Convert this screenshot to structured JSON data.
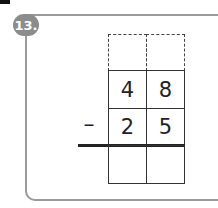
{
  "problem": {
    "number_label": "13.",
    "carry_row": [
      "",
      ""
    ],
    "minuend": [
      "4",
      "8"
    ],
    "operator": "–",
    "subtrahend": [
      "2",
      "5"
    ],
    "answer_row": [
      "",
      ""
    ]
  }
}
